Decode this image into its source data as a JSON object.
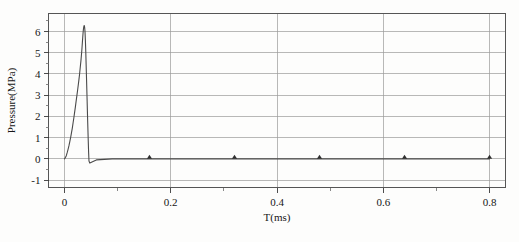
{
  "chart_data": {
    "type": "line",
    "title": "",
    "xlabel": "T(ms)",
    "ylabel": "Pressure(MPa)",
    "xlim": [
      -0.03,
      0.83
    ],
    "ylim": [
      -1.35,
      6.85
    ],
    "xticks": [
      0,
      0.2,
      0.4,
      0.6,
      0.8
    ],
    "xtick_labels": [
      "0",
      "0.2",
      "0.4",
      "0.6",
      "0.8"
    ],
    "xminor_ticks": [
      0.1,
      0.3,
      0.5,
      0.7
    ],
    "yticks": [
      -1,
      0,
      1,
      2,
      3,
      4,
      5,
      6
    ],
    "ytick_labels": [
      "-1",
      "0",
      "1",
      "2",
      "3",
      "4",
      "5",
      "6"
    ],
    "yminor_ticks": [
      -0.5,
      0.5,
      1.5,
      2.5,
      3.5,
      4.5,
      5.5,
      6.5
    ],
    "grid": true,
    "grid_axis": "both",
    "legend": "none",
    "series": [
      {
        "name": "Pressure",
        "line_color": "#4a4a4a",
        "x": [
          0.0,
          0.0018,
          0.0035,
          0.005,
          0.0068,
          0.0085,
          0.0102,
          0.0118,
          0.0132,
          0.0148,
          0.0163,
          0.0178,
          0.0192,
          0.0206,
          0.022,
          0.0234,
          0.0247,
          0.026,
          0.0272,
          0.0283,
          0.0293,
          0.0302,
          0.031,
          0.0318,
          0.0325,
          0.0332,
          0.0338,
          0.0344,
          0.035,
          0.0356,
          0.0362,
          0.0368,
          0.0374,
          0.038,
          0.0387,
          0.0394,
          0.0402,
          0.0412,
          0.0425,
          0.0437,
          0.0448,
          0.0455,
          0.0462,
          0.0478,
          0.06,
          0.09,
          0.13,
          0.2,
          0.3,
          0.4,
          0.5,
          0.6,
          0.7,
          0.8
        ],
        "y": [
          0.0,
          0.06,
          0.15,
          0.28,
          0.45,
          0.62,
          0.82,
          1.02,
          1.22,
          1.45,
          1.7,
          1.95,
          2.2,
          2.45,
          2.72,
          2.98,
          3.22,
          3.48,
          3.72,
          3.95,
          4.2,
          4.42,
          4.62,
          4.85,
          5.05,
          5.28,
          5.5,
          5.72,
          5.92,
          6.08,
          6.2,
          6.27,
          6.28,
          6.2,
          6.0,
          5.6,
          5.0,
          4.1,
          2.9,
          1.8,
          0.85,
          0.3,
          -0.1,
          -0.2,
          -0.05,
          0.0,
          0.0,
          0.0,
          0.0,
          0.0,
          0.0,
          0.0,
          0.0,
          0.0
        ]
      }
    ],
    "markers": {
      "shape": "triangle",
      "color": "#303030",
      "x": [
        0.16,
        0.32,
        0.48,
        0.64,
        0.8
      ],
      "y": [
        0,
        0,
        0,
        0,
        0
      ]
    },
    "peak": {
      "x": 0.037,
      "y": 6.28
    }
  }
}
